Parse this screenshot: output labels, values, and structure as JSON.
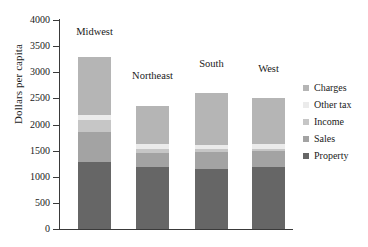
{
  "chart_data": {
    "type": "bar",
    "subtype": "stacked-bar",
    "title": "",
    "xlabel": "",
    "ylabel": "Dollars per capita",
    "ylim": [
      0,
      4000
    ],
    "ytick_values": [
      0,
      500,
      1000,
      1500,
      2000,
      2500,
      3000,
      3500,
      4000
    ],
    "ytick_labels": [
      "0",
      "500",
      "1000",
      "1500",
      "2000",
      "2500",
      "3000",
      "3500",
      "4000"
    ],
    "grid": false,
    "legend_position": "right",
    "categories": [
      "Midwest",
      "Northeast",
      "South",
      "West"
    ],
    "series": [
      {
        "name": "Property",
        "color": "#666666",
        "values": [
          1280,
          1180,
          1150,
          1190
        ]
      },
      {
        "name": "Sales",
        "color": "#a3a3a3",
        "values": [
          570,
          270,
          320,
          300
        ]
      },
      {
        "name": "Income",
        "color": "#c6c6c6",
        "values": [
          230,
          90,
          60,
          50
        ]
      },
      {
        "name": "Other tax",
        "color": "#ebebeb",
        "values": [
          100,
          90,
          80,
          90
        ]
      },
      {
        "name": "Charges",
        "color": "#b5b5b5",
        "values": [
          1120,
          720,
          990,
          870
        ]
      }
    ],
    "totals": [
      3300,
      2350,
      2600,
      2500
    ]
  }
}
